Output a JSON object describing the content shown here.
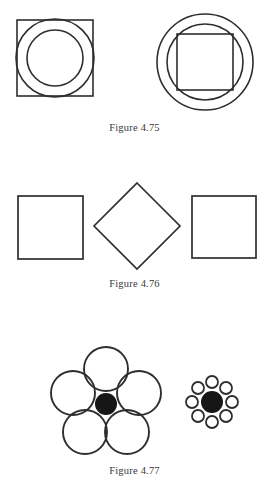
{
  "page": {
    "background_color": "#ffffff",
    "ink_color": "#2e2e2e",
    "fill_color": "#161616",
    "width": 269,
    "height": 492
  },
  "figures": [
    {
      "id": "figure-475",
      "caption": "Figure 4.75",
      "description": "Left: square with two concentric circles inscribed. Right: two concentric circles with a square inscribed in the inner circle.",
      "shapes": {
        "left": {
          "name": "square-with-concentric-circles",
          "square": {
            "x": 17,
            "y": 20,
            "size": 76
          },
          "outer_circle": {
            "cx": 55,
            "cy": 58,
            "r": 39
          },
          "inner_circle": {
            "cx": 55,
            "cy": 58,
            "r": 28
          }
        },
        "right": {
          "name": "concentric-circles-with-inscribed-square",
          "outer_circle": {
            "cx": 205,
            "cy": 62,
            "r": 48
          },
          "inner_circle": {
            "cx": 205,
            "cy": 62,
            "r": 38
          },
          "square": {
            "x": 177,
            "y": 34,
            "size": 56
          }
        }
      }
    },
    {
      "id": "figure-476",
      "caption": "Figure 4.76",
      "description": "Three squares in a row; the middle one is rotated 45 degrees into a diamond.",
      "shapes": {
        "left_square": {
          "x": 18,
          "y": 26,
          "width": 65,
          "height": 63
        },
        "middle_diamond": {
          "cx": 137,
          "cy": 56,
          "half_diagonal": 43,
          "rotation_degrees": 45
        },
        "right_square": {
          "x": 192,
          "y": 26,
          "width": 64,
          "height": 62
        }
      }
    },
    {
      "id": "figure-477",
      "caption": "Figure 4.77",
      "description": "Ebbinghaus illusion: identical black centre discs, one ringed by five large circles, the other by eight small circles.",
      "shapes": {
        "left_cluster": {
          "name": "large-surround-cluster",
          "center_disc": {
            "cx": 106,
            "cy": 79,
            "r": 11
          },
          "surround_count": 5,
          "surround_radius": 22,
          "surround_orbit": 35
        },
        "right_cluster": {
          "name": "small-surround-cluster",
          "center_disc": {
            "cx": 212,
            "cy": 77,
            "r": 11
          },
          "surround_count": 8,
          "surround_radius": 6,
          "surround_orbit": 20
        }
      }
    }
  ]
}
